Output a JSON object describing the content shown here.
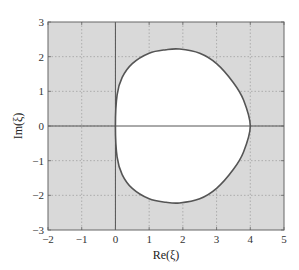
{
  "chart_data": {
    "type": "line",
    "title": "",
    "xlabel": "Re(ξ)",
    "ylabel": "Im(ξ)",
    "xlim": [
      -2,
      5
    ],
    "ylim": [
      -3,
      3
    ],
    "xticks": [
      "-2",
      "-1",
      "0",
      "1",
      "2",
      "3",
      "4",
      "5"
    ],
    "yticks": [
      "3",
      "2",
      "1",
      "0",
      "-1",
      "-2",
      "-3"
    ],
    "grid": true,
    "legend": null,
    "series": [
      {
        "name": "stability region boundary",
        "description": "Closed curve; interior (white) is unshaded, exterior shaded grey",
        "x": [
          0.0,
          0.05,
          0.2,
          0.5,
          1.0,
          1.5,
          1.9,
          2.5,
          3.0,
          3.5,
          3.8,
          4.0,
          3.8,
          3.5,
          3.0,
          2.5,
          1.9,
          1.5,
          1.0,
          0.5,
          0.2,
          0.05,
          0.0
        ],
        "y": [
          0.0,
          0.9,
          1.4,
          1.8,
          2.1,
          2.2,
          2.22,
          2.1,
          1.8,
          1.25,
          0.75,
          0.0,
          -0.75,
          -1.25,
          -1.8,
          -2.1,
          -2.22,
          -2.2,
          -2.1,
          -1.8,
          -1.4,
          -0.9,
          0.0
        ]
      }
    ],
    "colors": {
      "shade": "#d9d9d9",
      "curve": "#555555",
      "axis_lines": "#555555",
      "grid": "#9a9a9a"
    }
  }
}
